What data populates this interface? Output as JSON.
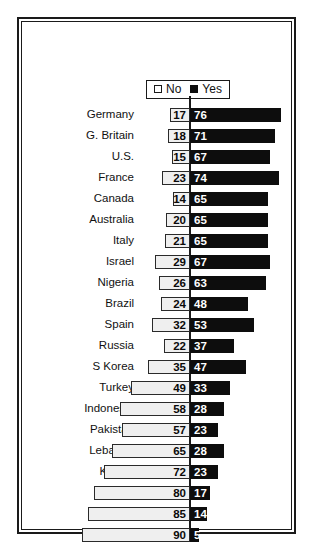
{
  "legend": {
    "position": "top-center",
    "entries": [
      {
        "label": "No",
        "icon": "open-square-icon",
        "color": "#ffffff"
      },
      {
        "label": "Yes",
        "icon": "filled-square-icon",
        "color": "#0d0d0d"
      }
    ]
  },
  "colors": {
    "no_fill": "#efefef",
    "no_border": "#2a2a2a",
    "yes_fill": "#0d0d0d",
    "frame": "#1a1a1a",
    "axis": "#1a1a1a",
    "background": "#ffffff"
  },
  "chart_data": {
    "type": "bar",
    "orientation": "horizontal",
    "subtype": "diverging-bidirectional",
    "title": "",
    "subtitle": "",
    "xlabel": "",
    "ylabel": "",
    "grid": false,
    "legend_position": "top-center",
    "axis_origin": 0,
    "xlim": [
      -100,
      100
    ],
    "categories": [
      "Germany",
      "G. Britain",
      "U.S.",
      "France",
      "Canada",
      "Australia",
      "Italy",
      "Israel",
      "Nigeria",
      "Brazil",
      "Spain",
      "Russia",
      "S Korea",
      "Turkey",
      "Indonesia",
      "Pakistan",
      "Lebanon",
      "Kuwait",
      "Palest.",
      "Jordan",
      "Morocco"
    ],
    "series": [
      {
        "name": "No",
        "direction": "left",
        "values": [
          17,
          18,
          15,
          23,
          14,
          20,
          21,
          29,
          26,
          24,
          32,
          22,
          35,
          49,
          58,
          57,
          65,
          72,
          80,
          85,
          90
        ]
      },
      {
        "name": "Yes",
        "direction": "right",
        "values": [
          76,
          71,
          67,
          74,
          65,
          65,
          65,
          67,
          63,
          48,
          53,
          37,
          47,
          33,
          28,
          23,
          28,
          23,
          17,
          14,
          5
        ]
      }
    ],
    "rows": [
      {
        "category": "Germany",
        "no": 17,
        "yes": 76
      },
      {
        "category": "G. Britain",
        "no": 18,
        "yes": 71
      },
      {
        "category": "U.S.",
        "no": 15,
        "yes": 67
      },
      {
        "category": "France",
        "no": 23,
        "yes": 74
      },
      {
        "category": "Canada",
        "no": 14,
        "yes": 65
      },
      {
        "category": "Australia",
        "no": 20,
        "yes": 65
      },
      {
        "category": "Italy",
        "no": 21,
        "yes": 65
      },
      {
        "category": "Israel",
        "no": 29,
        "yes": 67
      },
      {
        "category": "Nigeria",
        "no": 26,
        "yes": 63
      },
      {
        "category": "Brazil",
        "no": 24,
        "yes": 48
      },
      {
        "category": "Spain",
        "no": 32,
        "yes": 53
      },
      {
        "category": "Russia",
        "no": 22,
        "yes": 37
      },
      {
        "category": "S Korea",
        "no": 35,
        "yes": 47
      },
      {
        "category": "Turkey",
        "no": 49,
        "yes": 33
      },
      {
        "category": "Indonesia",
        "no": 58,
        "yes": 28
      },
      {
        "category": "Pakistan",
        "no": 57,
        "yes": 23
      },
      {
        "category": "Lebanon",
        "no": 65,
        "yes": 28
      },
      {
        "category": "Kuwait",
        "no": 72,
        "yes": 23
      },
      {
        "category": "Palest.",
        "no": 80,
        "yes": 17
      },
      {
        "category": "Jordan",
        "no": 85,
        "yes": 14
      },
      {
        "category": "Morocco",
        "no": 90,
        "yes": 5
      }
    ]
  }
}
